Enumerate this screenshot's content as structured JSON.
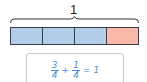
{
  "diagram": {
    "whole_label": "1",
    "bar": {
      "segments": [
        {
          "label": "1/4",
          "color": "#b3cde8",
          "state": "blue"
        },
        {
          "label": "1/4",
          "color": "#b3cde8",
          "state": "blue"
        },
        {
          "label": "1/4",
          "color": "#b3cde8",
          "state": "blue"
        },
        {
          "label": "1/4",
          "color": "#f7b8a8",
          "state": "red"
        }
      ]
    },
    "equation": {
      "term1": {
        "numerator": "3",
        "denominator": "4"
      },
      "operator": "+",
      "term2": {
        "numerator": "1",
        "denominator": "4"
      },
      "equals": "=",
      "result": "1",
      "color": "#4a8fd6"
    }
  }
}
